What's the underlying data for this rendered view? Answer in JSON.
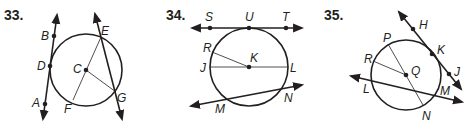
{
  "problems": [
    {
      "number": "33.",
      "center": "C",
      "points": {
        "B": "B",
        "D": "D",
        "A": "A",
        "E": "E",
        "C": "C",
        "F": "F",
        "G": "G"
      },
      "elements": {
        "tangent_line": [
          "A",
          "D",
          "B"
        ],
        "secant_line": [
          "E",
          "G"
        ],
        "chord": [
          "E",
          "F"
        ],
        "radius": [
          "C",
          "G"
        ]
      }
    },
    {
      "number": "34.",
      "center": "K",
      "points": {
        "S": "S",
        "U": "U",
        "T": "T",
        "R": "R",
        "K": "K",
        "J": "J",
        "L": "L",
        "M": "M",
        "N": "N"
      },
      "elements": {
        "tangent_line": [
          "S",
          "U",
          "T"
        ],
        "diameter": [
          "J",
          "L"
        ],
        "radius": [
          "K",
          "R"
        ],
        "secant_line": [
          "M",
          "N"
        ]
      }
    },
    {
      "number": "35.",
      "center": "Q",
      "points": {
        "H": "H",
        "P": "P",
        "K": "K",
        "R": "R",
        "Q": "Q",
        "J": "J",
        "L": "L",
        "M": "M",
        "N": "N"
      },
      "elements": {
        "tangent_line": [
          "H",
          "K",
          "J"
        ],
        "chord": [
          "P",
          "N"
        ],
        "radius": [
          "Q",
          "R"
        ],
        "secant_line": [
          "L",
          "M"
        ]
      }
    }
  ]
}
